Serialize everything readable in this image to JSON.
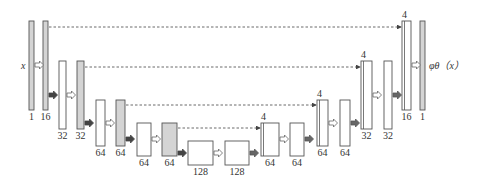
{
  "diagram": {
    "type": "U-Net architecture",
    "colors": {
      "bar_stroke": "#555555",
      "bar_gray_fill": "#d4d4d4",
      "bar_white_fill": "#ffffff",
      "arrow_dark": "#444444",
      "arrow_light_fill": "#ffffff",
      "arrow_light_stroke": "#666666",
      "skip_line": "#444444",
      "text": "#333333"
    },
    "input_label": "x",
    "output_label": "φθ（x）",
    "bars": [
      {
        "id": "b1",
        "x": 29,
        "y": 21,
        "w": 5,
        "h": 89,
        "fill": "gray",
        "label": "1",
        "split": false
      },
      {
        "id": "b2",
        "x": 43,
        "y": 21,
        "w": 5,
        "h": 89,
        "fill": "gray",
        "label": "16",
        "split": false
      },
      {
        "id": "b3",
        "x": 59,
        "y": 61,
        "w": 7,
        "h": 68,
        "fill": "white",
        "label": "32",
        "split": false
      },
      {
        "id": "b4",
        "x": 77,
        "y": 61,
        "w": 7,
        "h": 68,
        "fill": "gray",
        "label": "32",
        "split": false
      },
      {
        "id": "b5",
        "x": 96,
        "y": 100,
        "w": 9,
        "h": 46,
        "fill": "white",
        "label": "64",
        "split": false
      },
      {
        "id": "b6",
        "x": 116,
        "y": 100,
        "w": 9,
        "h": 46,
        "fill": "gray",
        "label": "64",
        "split": false
      },
      {
        "id": "b7",
        "x": 137,
        "y": 123,
        "w": 14,
        "h": 33,
        "fill": "white",
        "label": "64",
        "split": false
      },
      {
        "id": "b8",
        "x": 162,
        "y": 123,
        "w": 15,
        "h": 33,
        "fill": "gray",
        "label": "64",
        "split": false
      },
      {
        "id": "b9",
        "x": 188,
        "y": 141,
        "w": 25,
        "h": 24,
        "fill": "white",
        "label": "128",
        "split": false
      },
      {
        "id": "b10",
        "x": 225,
        "y": 141,
        "w": 24,
        "h": 24,
        "fill": "white",
        "label": "128",
        "split": false
      },
      {
        "id": "b11",
        "x": 261,
        "y": 123,
        "w": 18,
        "h": 33,
        "fill": "white",
        "label": "64",
        "split": true,
        "top_label": "4"
      },
      {
        "id": "b12",
        "x": 290,
        "y": 123,
        "w": 14,
        "h": 33,
        "fill": "white",
        "label": "64",
        "split": false
      },
      {
        "id": "b13",
        "x": 317,
        "y": 100,
        "w": 11,
        "h": 46,
        "fill": "white",
        "label": "64",
        "split": true,
        "top_label": "4"
      },
      {
        "id": "b14",
        "x": 340,
        "y": 100,
        "w": 10,
        "h": 46,
        "fill": "white",
        "label": "64",
        "split": false
      },
      {
        "id": "b15",
        "x": 361,
        "y": 61,
        "w": 11,
        "h": 68,
        "fill": "white",
        "label": "32",
        "split": true,
        "top_label": "4"
      },
      {
        "id": "b16",
        "x": 384,
        "y": 61,
        "w": 8,
        "h": 68,
        "fill": "white",
        "label": "32",
        "split": false
      },
      {
        "id": "b17",
        "x": 402,
        "y": 21,
        "w": 9,
        "h": 89,
        "fill": "white",
        "label": "16",
        "split": true,
        "top_label": "4"
      },
      {
        "id": "b18",
        "x": 420,
        "y": 21,
        "w": 5,
        "h": 89,
        "fill": "gray",
        "label": "1",
        "split": false
      }
    ],
    "conv_arrows": [
      {
        "x": 35,
        "y": 65
      },
      {
        "x": 67,
        "y": 95
      },
      {
        "x": 106,
        "y": 123
      },
      {
        "x": 152,
        "y": 139
      },
      {
        "x": 214,
        "y": 153
      },
      {
        "x": 280,
        "y": 139
      },
      {
        "x": 329,
        "y": 123
      },
      {
        "x": 373,
        "y": 95
      },
      {
        "x": 412,
        "y": 65
      }
    ],
    "down_arrows": [
      {
        "x": 49,
        "y": 95
      },
      {
        "x": 85,
        "y": 123
      },
      {
        "x": 126,
        "y": 139
      },
      {
        "x": 178,
        "y": 153
      }
    ],
    "up_arrows": [
      {
        "x": 250,
        "y": 153
      },
      {
        "x": 305,
        "y": 139
      },
      {
        "x": 351,
        "y": 123
      },
      {
        "x": 393,
        "y": 95
      }
    ],
    "skip_connections": [
      {
        "x1": 49,
        "x2": 401,
        "y": 27
      },
      {
        "x1": 85,
        "x2": 360,
        "y": 67
      },
      {
        "x1": 126,
        "x2": 316,
        "y": 105
      },
      {
        "x1": 178,
        "x2": 260,
        "y": 128
      }
    ]
  }
}
